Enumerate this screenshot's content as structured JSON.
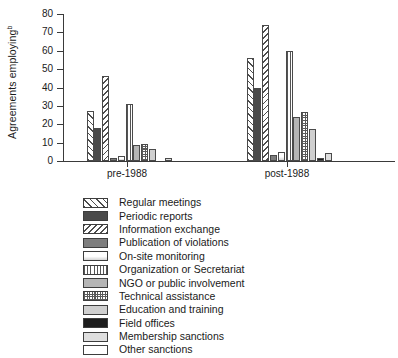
{
  "chart_data": {
    "type": "bar",
    "title": "",
    "xlabel": "",
    "ylabel": "Agreements employing",
    "ylabel_superscript": "b",
    "categories": [
      "pre-1988",
      "post-1988"
    ],
    "ylim": [
      0,
      80
    ],
    "ytick_labels": [
      "0",
      "10",
      "20",
      "30",
      "40",
      "50",
      "60",
      "70",
      "80"
    ],
    "ytick_values": [
      0,
      10,
      20,
      30,
      40,
      50,
      60,
      70,
      80
    ],
    "grid": false,
    "legend_position": "below",
    "series": [
      {
        "name": "Regular meetings",
        "pattern": "diagonal-hatch-wide",
        "values": [
          27,
          56
        ]
      },
      {
        "name": "Periodic reports",
        "pattern": "solid-dark-grey",
        "values": [
          18,
          40
        ]
      },
      {
        "name": "Information exchange",
        "pattern": "diagonal-hatch-reverse",
        "values": [
          46,
          74
        ]
      },
      {
        "name": "Publication of violations",
        "pattern": "medium-grey",
        "values": [
          1.5,
          3.5
        ]
      },
      {
        "name": "On-site monitoring",
        "pattern": "light-gradient",
        "values": [
          2.5,
          5
        ]
      },
      {
        "name": "Organization or Secretariat",
        "pattern": "vertical-stripes",
        "values": [
          31,
          60
        ]
      },
      {
        "name": "NGO or public involvement",
        "pattern": "light-grey",
        "values": [
          8.5,
          24
        ]
      },
      {
        "name": "Technical assistance",
        "pattern": "checkerboard",
        "values": [
          9.5,
          26.5
        ]
      },
      {
        "name": "Education and training",
        "pattern": "pale-grey",
        "values": [
          6.5,
          17.5
        ]
      },
      {
        "name": "Field offices",
        "pattern": "black",
        "values": [
          0,
          1.5
        ]
      },
      {
        "name": "Membership sanctions",
        "pattern": "very-light-grey",
        "values": [
          1.5,
          4.5
        ]
      },
      {
        "name": "Other sanctions",
        "pattern": "white",
        "values": [
          0,
          0
        ]
      }
    ]
  },
  "axis": {
    "y_title": "Agreements employing",
    "y_title_sup": "b"
  }
}
